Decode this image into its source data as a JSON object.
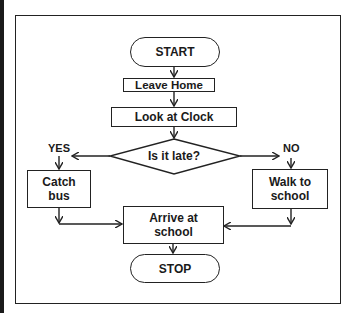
{
  "flowchart": {
    "nodes": {
      "start": "START",
      "leave_home": "Leave Home",
      "look_clock": "Look at Clock",
      "decision": "Is it late?",
      "catch_bus_line1": "Catch",
      "catch_bus_line2": "bus",
      "walk_line1": "Walk to",
      "walk_line2": "school",
      "arrive_line1": "Arrive at",
      "arrive_line2": "school",
      "stop": "STOP"
    },
    "branches": {
      "yes": "YES",
      "no": "NO"
    },
    "colors": {
      "stroke": "#222222",
      "background": "#ffffff"
    }
  }
}
